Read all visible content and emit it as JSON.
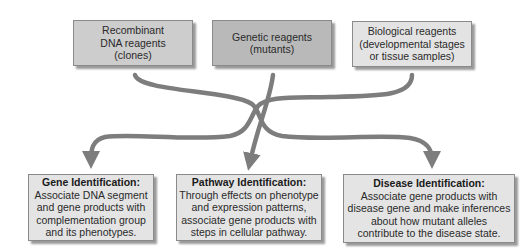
{
  "sources": [
    {
      "lines": [
        "Recombinant",
        "DNA reagents",
        "(clones)"
      ]
    },
    {
      "lines": [
        "Genetic reagents",
        "(mutants)"
      ]
    },
    {
      "lines": [
        "Biological reagents",
        "(developmental stages",
        "or tissue samples)"
      ]
    }
  ],
  "outcomes": [
    {
      "title": "Gene Identification:",
      "lines": [
        "Associate DNA segment",
        "and gene products with",
        "complementation group",
        "and its phenotypes."
      ]
    },
    {
      "title": "Pathway Identification:",
      "lines": [
        "Through effects on phenotype",
        "and expression patterns,",
        "associate gene products with",
        "steps in cellular pathway."
      ]
    },
    {
      "title": "Disease Identification:",
      "lines": [
        "Associate gene products with",
        "disease gene and make inferences",
        "about how mutant alleles",
        "contribute to the disease state."
      ]
    }
  ],
  "colors": {
    "arrow": "#7d7d7d",
    "source_box_1": "#cdcdcd",
    "source_box_2": "#b9b9b9",
    "source_box_3": "#e3e3e3",
    "outcome_box": "#e4e4e4"
  }
}
